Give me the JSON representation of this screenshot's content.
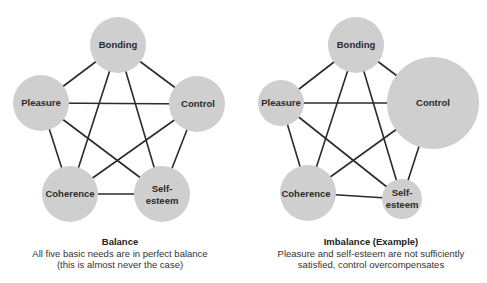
{
  "colors": {
    "node_fill": "#cfcfcf",
    "edge": "#2b2b2b",
    "text": "#2a2a2a"
  },
  "diagrams": [
    {
      "id": "balance",
      "nodes": {
        "bonding": {
          "label": "Bonding",
          "cx": 118,
          "cy": 45,
          "r": 28
        },
        "pleasure": {
          "label": "Pleasure",
          "cx": 41,
          "cy": 103,
          "r": 28
        },
        "control": {
          "label": "Control",
          "cx": 197,
          "cy": 104,
          "r": 28
        },
        "coherence": {
          "label": "Coherence",
          "cx": 70,
          "cy": 194,
          "r": 28
        },
        "self_esteem": {
          "label_line1": "Self-",
          "label_line2": "esteem",
          "cx": 162,
          "cy": 194,
          "r": 28
        }
      },
      "caption": {
        "title": "Balance",
        "line1": "All five basic needs are in perfect balance",
        "line2": "(this is almost never the case)"
      }
    },
    {
      "id": "imbalance",
      "nodes": {
        "bonding": {
          "label": "Bonding",
          "cx": 356,
          "cy": 45,
          "r": 28
        },
        "pleasure": {
          "label": "Pleasure",
          "cx": 281,
          "cy": 103,
          "r": 23
        },
        "control": {
          "label": "Control",
          "cx": 433,
          "cy": 103,
          "r": 46
        },
        "coherence": {
          "label": "Coherence",
          "cx": 308,
          "cy": 193,
          "r": 28
        },
        "self_esteem": {
          "label_line1": "Self-",
          "label_line2": "esteem",
          "cx": 402,
          "cy": 199,
          "r": 20
        }
      },
      "caption": {
        "title": "Imbalance (Example)",
        "line1": "Pleasure and self-esteem are not sufficiently",
        "line2": "satisfied, control overcompensates"
      }
    }
  ]
}
